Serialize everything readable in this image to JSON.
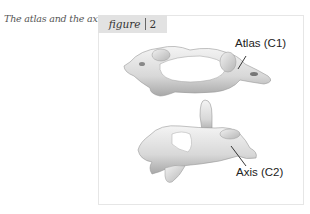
{
  "caption": "The atlas and the axis.",
  "figure_tab": {
    "label": "figure",
    "number": "2"
  },
  "labels": {
    "atlas": "Atlas (C1)",
    "axis": "Axis (C2)"
  }
}
